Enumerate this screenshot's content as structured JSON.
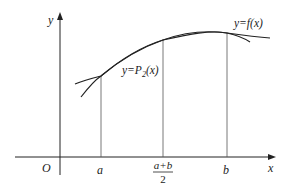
{
  "diagram": {
    "type": "function-approximation",
    "axes": {
      "x_label": "x",
      "y_label": "y",
      "origin_label": "O"
    },
    "x_ticks": [
      {
        "id": "a",
        "label": "a"
      },
      {
        "id": "mid",
        "numerator": "a+b",
        "denominator": "2"
      },
      {
        "id": "b",
        "label": "b"
      }
    ],
    "curves": [
      {
        "id": "f",
        "label": "y=f(x)"
      },
      {
        "id": "P2",
        "label_prefix": "y=P",
        "label_sub": "2",
        "label_suffix": "(x)"
      }
    ],
    "colors": {
      "stroke": "#222222",
      "guide": "#555555",
      "background": "#ffffff"
    }
  }
}
